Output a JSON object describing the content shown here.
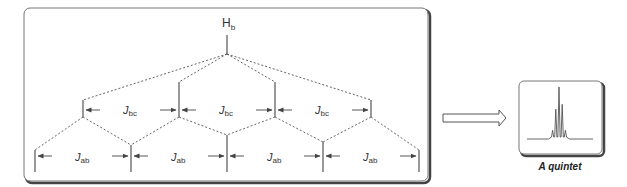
{
  "splitting_tree": {
    "top_label": {
      "main": "H",
      "sub": "b"
    },
    "level1": {
      "coupling_labels": [
        {
          "main": "J",
          "sub": "bc"
        },
        {
          "main": "J",
          "sub": "bc"
        },
        {
          "main": "J",
          "sub": "bc"
        }
      ]
    },
    "level2": {
      "coupling_labels": [
        {
          "main": "J",
          "sub": "ab"
        },
        {
          "main": "J",
          "sub": "ab"
        },
        {
          "main": "J",
          "sub": "ab"
        },
        {
          "main": "J",
          "sub": "ab"
        }
      ]
    },
    "line_counts": {
      "level1": 4,
      "level2": 5
    }
  },
  "result": {
    "caption": "A quintet",
    "relative_intensities": [
      1,
      4,
      6,
      4,
      1
    ]
  },
  "colors": {
    "line": "#555555",
    "frame": "#666666",
    "frame_shadow": "#444444"
  }
}
